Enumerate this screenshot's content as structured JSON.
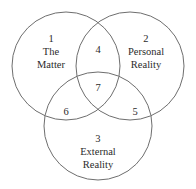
{
  "diagram": {
    "type": "venn",
    "title": "",
    "background_color": "#ffffff",
    "stroke_color": "#6e6e6e",
    "text_color": "#2b2b2b",
    "sets": [
      {
        "id": "matter",
        "number": "1",
        "name_lines": [
          "The",
          "Matter"
        ],
        "position": "top-left"
      },
      {
        "id": "personal-reality",
        "number": "2",
        "name_lines": [
          "Personal",
          "Reality"
        ],
        "position": "top-right"
      },
      {
        "id": "external-reality",
        "number": "3",
        "name_lines": [
          "External",
          "Reality"
        ],
        "position": "bottom"
      }
    ],
    "regions": [
      {
        "id": "matter-personal",
        "number": "4",
        "position": "top-center"
      },
      {
        "id": "personal-external",
        "number": "5",
        "position": "right-lower"
      },
      {
        "id": "matter-external",
        "number": "6",
        "position": "left-lower"
      },
      {
        "id": "all-three",
        "number": "7",
        "position": "center"
      }
    ]
  }
}
